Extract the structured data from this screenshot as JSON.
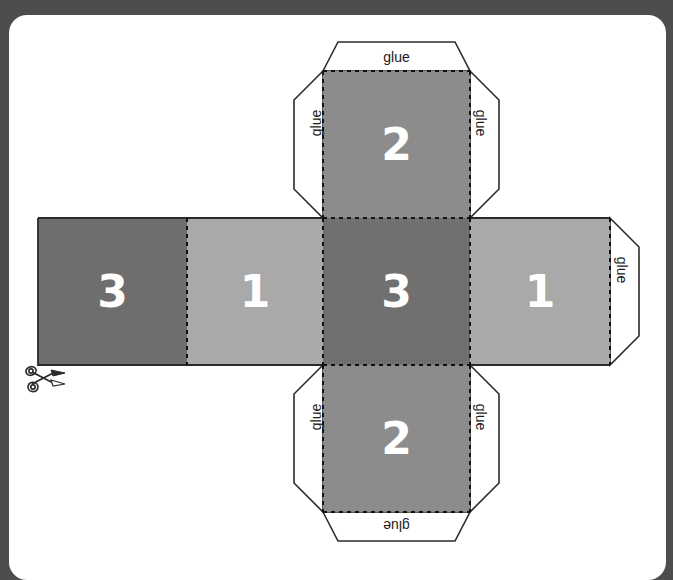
{
  "document": {
    "type": "cube-net-craft-template",
    "background_color": "#4d4d4d",
    "page_color": "#ffffff"
  },
  "palette": {
    "face_dark": "#6e6e6e",
    "face_center_dark": "#707070",
    "face_light": "#a9a9a9",
    "face_medium": "#8c8c8c",
    "outline": "#2b2b2b",
    "fold_line": "#111111",
    "label_text": "#ffffff",
    "glue_text": "#1a1a1a"
  },
  "net": {
    "faces": [
      {
        "id": "face-left-3",
        "label": "3",
        "color": "#6e6e6e",
        "x": 38,
        "y": 218,
        "w": 149,
        "h": 147
      },
      {
        "id": "face-mid-1",
        "label": "1",
        "color": "#a9a9a9",
        "x": 187,
        "y": 218,
        "w": 136,
        "h": 147
      },
      {
        "id": "face-center-3",
        "label": "3",
        "color": "#707070",
        "x": 323,
        "y": 218,
        "w": 147,
        "h": 147
      },
      {
        "id": "face-right-1",
        "label": "1",
        "color": "#a9a9a9",
        "x": 470,
        "y": 218,
        "w": 140,
        "h": 147
      },
      {
        "id": "face-top-2",
        "label": "2",
        "color": "#8c8c8c",
        "x": 323,
        "y": 71,
        "w": 147,
        "h": 147
      },
      {
        "id": "face-bottom-2",
        "label": "2",
        "color": "#8c8c8c",
        "x": 323,
        "y": 365,
        "w": 147,
        "h": 147
      }
    ],
    "glue_flaps": [
      {
        "id": "glue-top",
        "label": "glue",
        "orientation": "horizontal",
        "position": "top-of-top-face"
      },
      {
        "id": "glue-top-left",
        "label": "glue",
        "orientation": "vertical-up",
        "position": "left-of-top-face"
      },
      {
        "id": "glue-top-right",
        "label": "glue",
        "orientation": "vertical-down",
        "position": "right-of-top-face"
      },
      {
        "id": "glue-right",
        "label": "glue",
        "orientation": "vertical-down",
        "position": "right-of-right-face"
      },
      {
        "id": "glue-bottom-left",
        "label": "glue",
        "orientation": "vertical-up",
        "position": "left-of-bottom-face"
      },
      {
        "id": "glue-bottom-right",
        "label": "glue",
        "orientation": "vertical-down",
        "position": "right-of-bottom-face"
      },
      {
        "id": "glue-bottom",
        "label": "glue",
        "orientation": "upside-down",
        "position": "bottom-of-bottom-face"
      }
    ],
    "cut_marker": {
      "id": "scissors",
      "icon": "scissors-icon",
      "x": 24,
      "y": 362
    }
  },
  "labels": {
    "glue": "glue",
    "face_3": "3",
    "face_1": "1",
    "face_2": "2"
  }
}
